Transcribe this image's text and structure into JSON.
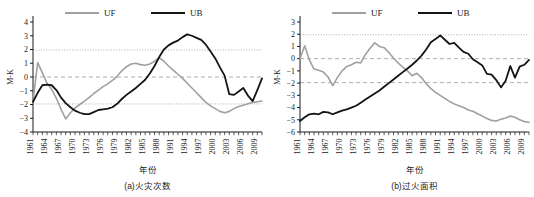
{
  "figure": {
    "panels": [
      {
        "id": "panel-a",
        "caption": "(a)火灾次数",
        "ylabel": "M-K",
        "xlabel": "年份",
        "chart_data": {
          "type": "line",
          "title": "(a)火灾次数",
          "xlabel": "年份",
          "ylabel": "M-K",
          "xlim": [
            1961,
            2010
          ],
          "ylim": [
            -4,
            4
          ],
          "yticks": [
            -4,
            -3,
            -2,
            -1,
            0,
            1,
            2,
            3,
            4
          ],
          "xticks": [
            1961,
            1964,
            1967,
            1970,
            1973,
            1976,
            1979,
            1982,
            1985,
            1988,
            1991,
            1994,
            1997,
            2000,
            2003,
            2006,
            2009
          ],
          "grid": false,
          "legend_position": "top",
          "reference_lines": [
            {
              "value": 1.96,
              "style": "dotted",
              "color": "#9a9a9a"
            },
            {
              "value": 0,
              "style": "dashed",
              "color": "#9a9a9a"
            },
            {
              "value": -1.96,
              "style": "dotted",
              "color": "#9a9a9a"
            }
          ],
          "x": [
            1961,
            1962,
            1963,
            1964,
            1965,
            1966,
            1967,
            1968,
            1969,
            1970,
            1971,
            1972,
            1973,
            1974,
            1975,
            1976,
            1977,
            1978,
            1979,
            1980,
            1981,
            1982,
            1983,
            1984,
            1985,
            1986,
            1987,
            1988,
            1989,
            1990,
            1991,
            1992,
            1993,
            1994,
            1995,
            1996,
            1997,
            1998,
            1999,
            2000,
            2001,
            2002,
            2003,
            2004,
            2005,
            2006,
            2007,
            2008,
            2009,
            2010
          ],
          "series": [
            {
              "name": "UF",
              "color": "#a0a0a0",
              "values": [
                -1.75,
                1.05,
                0.3,
                -0.45,
                -0.9,
                -1.55,
                -2.35,
                -3.05,
                -2.6,
                -2.25,
                -2.0,
                -1.75,
                -1.5,
                -1.2,
                -0.95,
                -0.7,
                -0.5,
                -0.25,
                0.05,
                0.45,
                0.75,
                0.95,
                1.0,
                0.9,
                0.85,
                0.95,
                1.15,
                1.4,
                1.15,
                0.8,
                0.5,
                0.2,
                -0.1,
                -0.45,
                -0.8,
                -1.15,
                -1.5,
                -1.85,
                -2.1,
                -2.3,
                -2.5,
                -2.6,
                -2.5,
                -2.3,
                -2.15,
                -2.05,
                -1.95,
                -1.85,
                -1.8,
                -1.75
              ]
            },
            {
              "name": "UB",
              "color": "#141414",
              "values": [
                -1.8,
                -1.15,
                -0.6,
                -0.55,
                -0.6,
                -0.95,
                -1.5,
                -1.9,
                -2.2,
                -2.45,
                -2.6,
                -2.7,
                -2.7,
                -2.55,
                -2.4,
                -2.35,
                -2.3,
                -2.2,
                -1.95,
                -1.6,
                -1.3,
                -1.05,
                -0.8,
                -0.5,
                -0.2,
                0.25,
                0.8,
                1.45,
                2.0,
                2.3,
                2.5,
                2.65,
                2.9,
                3.1,
                3.0,
                2.85,
                2.7,
                2.35,
                1.85,
                1.35,
                0.7,
                0.1,
                -1.25,
                -1.3,
                -1.05,
                -0.8,
                -1.35,
                -1.75,
                -0.95,
                -0.1
              ]
            }
          ]
        }
      },
      {
        "id": "panel-b",
        "caption": "(b)过火面积",
        "ylabel": "M-K",
        "xlabel": "年份",
        "chart_data": {
          "type": "line",
          "title": "(b)过火面积",
          "xlabel": "年份",
          "ylabel": "M-K",
          "xlim": [
            1961,
            2010
          ],
          "ylim": [
            -6,
            3
          ],
          "yticks": [
            -6,
            -5,
            -4,
            -3,
            -2,
            -1,
            0,
            1,
            2,
            3
          ],
          "xticks": [
            1961,
            1964,
            1967,
            1970,
            1973,
            1976,
            1979,
            1982,
            1985,
            1988,
            1991,
            1994,
            1997,
            2000,
            2003,
            2006,
            2009
          ],
          "grid": false,
          "legend_position": "top",
          "reference_lines": [
            {
              "value": 1.96,
              "style": "dotted",
              "color": "#9a9a9a"
            },
            {
              "value": 0,
              "style": "dashed",
              "color": "#9a9a9a"
            },
            {
              "value": -1.96,
              "style": "dashed",
              "color": "#9a9a9a"
            }
          ],
          "x": [
            1961,
            1962,
            1963,
            1964,
            1965,
            1966,
            1967,
            1968,
            1969,
            1970,
            1971,
            1972,
            1973,
            1974,
            1975,
            1976,
            1977,
            1978,
            1979,
            1980,
            1981,
            1982,
            1983,
            1984,
            1985,
            1986,
            1987,
            1988,
            1989,
            1990,
            1991,
            1992,
            1993,
            1994,
            1995,
            1996,
            1997,
            1998,
            1999,
            2000,
            2001,
            2002,
            2003,
            2004,
            2005,
            2006,
            2007,
            2008,
            2009,
            2010
          ],
          "series": [
            {
              "name": "UF",
              "color": "#a0a0a0",
              "values": [
                0.0,
                1.05,
                -0.1,
                -0.85,
                -0.95,
                -1.1,
                -1.5,
                -2.2,
                -1.55,
                -1.0,
                -0.65,
                -0.5,
                -0.3,
                -0.35,
                0.35,
                0.85,
                1.3,
                1.0,
                0.9,
                0.5,
                0.05,
                -0.35,
                -0.7,
                -1.0,
                -1.4,
                -1.2,
                -1.55,
                -2.05,
                -2.45,
                -2.75,
                -3.0,
                -3.25,
                -3.5,
                -3.7,
                -3.85,
                -4.0,
                -4.2,
                -4.3,
                -4.5,
                -4.7,
                -4.9,
                -5.05,
                -5.1,
                -4.95,
                -4.85,
                -4.7,
                -4.8,
                -5.0,
                -5.15,
                -5.2
              ]
            },
            {
              "name": "UB",
              "color": "#141414",
              "values": [
                -5.1,
                -4.8,
                -4.55,
                -4.5,
                -4.55,
                -4.35,
                -4.4,
                -4.55,
                -4.4,
                -4.25,
                -4.15,
                -4.0,
                -3.85,
                -3.6,
                -3.35,
                -3.1,
                -2.85,
                -2.6,
                -2.3,
                -2.0,
                -1.7,
                -1.4,
                -1.1,
                -0.8,
                -0.5,
                -0.15,
                0.25,
                0.75,
                1.35,
                1.6,
                1.9,
                1.55,
                1.2,
                1.3,
                0.9,
                0.55,
                0.4,
                -0.05,
                -0.3,
                -0.55,
                -1.25,
                -1.3,
                -1.75,
                -2.35,
                -1.8,
                -0.6,
                -1.55,
                -0.65,
                -0.5,
                -0.1
              ]
            }
          ]
        }
      }
    ],
    "legend": {
      "entries": [
        {
          "label": "UF",
          "color": "#a0a0a0"
        },
        {
          "label": "UB",
          "color": "#141414"
        }
      ]
    }
  }
}
